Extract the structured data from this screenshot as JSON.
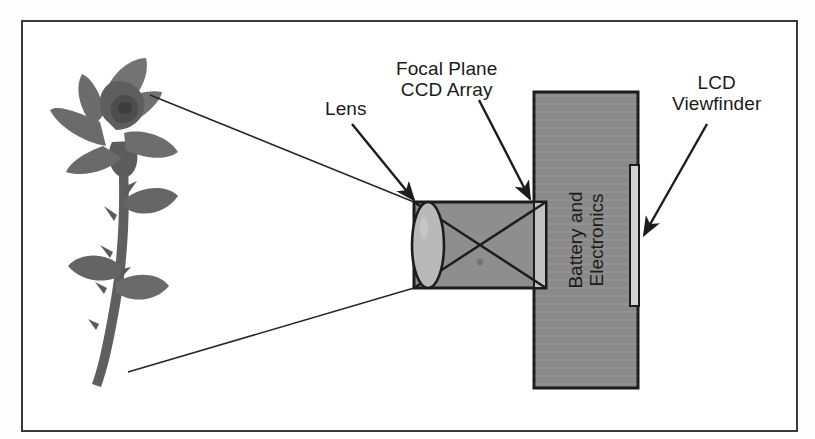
{
  "figure": {
    "background": "#ffffff",
    "border_color": "#3a3a3a"
  },
  "labels": {
    "lens": "Lens",
    "ccd_array": "Focal Plane\nCCD Array",
    "lcd_viewfinder": "LCD\nViewfinder",
    "battery_electronics": "Battery and\nElectronics"
  },
  "colors": {
    "body_gray": "#8a8a8a",
    "lens_box_gray": "#8e8e8e",
    "lens_glass_gray": "#b9b9b9",
    "ccd_strip_gray": "#c2c2c2",
    "lcd_strip_gray": "#d2d2d2",
    "rose_gray": "#6f6f6f",
    "stroke": "#1c1c1c"
  },
  "parts": {
    "camera_body": {
      "x": 534,
      "y": 92,
      "w": 104,
      "h": 296
    },
    "lens_housing": {
      "x": 414,
      "y": 202,
      "w": 132,
      "h": 86
    },
    "lens_element": {
      "cx": 428,
      "cy": 245,
      "rx": 16,
      "ry": 43
    },
    "ccd_strip": {
      "x": 534,
      "y": 202,
      "w": 12,
      "h": 86
    },
    "lcd_strip": {
      "x": 630,
      "y": 165,
      "w": 9,
      "h": 141
    }
  },
  "rays": {
    "top_ray": "rose top to lens top-left",
    "bottom_ray": "rose stem base to lens bottom-left",
    "cross_rays": "X inside lens housing"
  },
  "subject": {
    "name": "rose",
    "x": 55,
    "y": 85,
    "w": 130,
    "h": 300
  }
}
